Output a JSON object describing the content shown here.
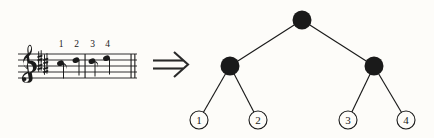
{
  "figure": {
    "name": "music-to-tree-diagram",
    "background_color": "#fdfcf9",
    "ink_color": "#1a1a1a"
  },
  "music": {
    "clef": "treble-clef",
    "clef_glyph": "𝄞",
    "key_signature": "sharps",
    "staff_lines": 5,
    "barline_count": 2,
    "note_numbers": [
      "1",
      "2",
      "3",
      "4"
    ],
    "measures": [
      {
        "index": 1,
        "notes": [
          {
            "label": "1",
            "type": "eighth-note",
            "flag": true
          },
          {
            "label": "2",
            "type": "quarter-note",
            "flag": false
          }
        ]
      },
      {
        "index": 2,
        "notes": [
          {
            "label": "3",
            "type": "eighth-note",
            "flag": true
          },
          {
            "label": "4",
            "type": "quarter-note",
            "flag": false
          }
        ]
      }
    ]
  },
  "arrow": {
    "symbol": "⇒",
    "name": "double-right-arrow",
    "meaning": "maps to"
  },
  "tree": {
    "nodes": [
      {
        "id": "root",
        "label": "",
        "kind": "internal",
        "x": 124,
        "y": 20,
        "r": 9
      },
      {
        "id": "left",
        "label": "",
        "kind": "internal",
        "x": 52,
        "y": 66,
        "r": 9
      },
      {
        "id": "right",
        "label": "",
        "kind": "internal",
        "x": 196,
        "y": 66,
        "r": 9
      },
      {
        "id": "leaf1",
        "label": "1",
        "kind": "leaf",
        "x": 21,
        "y": 120,
        "r": 9
      },
      {
        "id": "leaf2",
        "label": "2",
        "kind": "leaf",
        "x": 80,
        "y": 120,
        "r": 9
      },
      {
        "id": "leaf3",
        "label": "3",
        "kind": "leaf",
        "x": 170,
        "y": 120,
        "r": 9
      },
      {
        "id": "leaf4",
        "label": "4",
        "kind": "leaf",
        "x": 228,
        "y": 120,
        "r": 9
      }
    ],
    "edges": [
      {
        "from": "root",
        "to": "left"
      },
      {
        "from": "root",
        "to": "right"
      },
      {
        "from": "left",
        "to": "leaf1"
      },
      {
        "from": "left",
        "to": "leaf2"
      },
      {
        "from": "right",
        "to": "leaf3"
      },
      {
        "from": "right",
        "to": "leaf4"
      }
    ],
    "leaf_labels": [
      "1",
      "2",
      "3",
      "4"
    ]
  }
}
